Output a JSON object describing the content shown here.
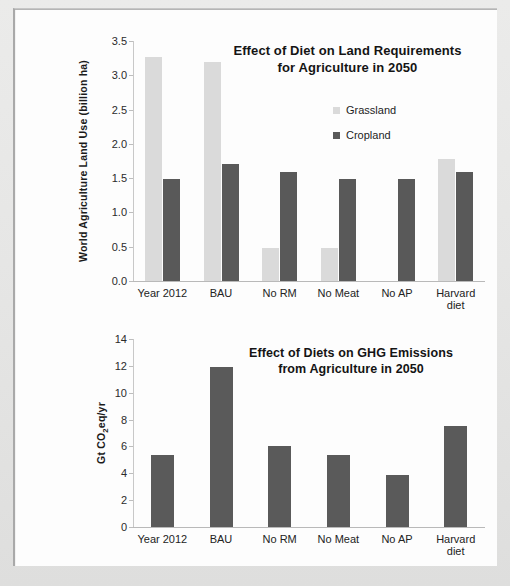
{
  "chart_data": [
    {
      "type": "bar",
      "id": "land-use",
      "title": "Effect of Diet on Land Requirements for Agriculture in 2050",
      "title_lines": [
        "Effect of Diet on Land Requirements",
        "for Agriculture in 2050"
      ],
      "xlabel": "",
      "ylabel": "World Agriculture Land Use (billion ha)",
      "ylim": [
        0.0,
        3.5
      ],
      "yticks": [
        "0.0",
        "0.5",
        "1.0",
        "1.5",
        "2.0",
        "2.5",
        "3.0",
        "3.5"
      ],
      "ytick_values": [
        0.0,
        0.5,
        1.0,
        1.5,
        2.0,
        2.5,
        3.0,
        3.5
      ],
      "grid": false,
      "legend_position": "inside-top-right",
      "categories": [
        "Year 2012",
        "BAU",
        "No RM",
        "No Meat",
        "No AP",
        "Harvard diet"
      ],
      "category_lines": [
        [
          "Year 2012"
        ],
        [
          "BAU"
        ],
        [
          "No RM"
        ],
        [
          "No Meat"
        ],
        [
          "No AP"
        ],
        [
          "Harvard",
          "diet"
        ]
      ],
      "series": [
        {
          "name": "Grassland",
          "color": "#dadada",
          "values": [
            3.27,
            3.19,
            0.48,
            0.48,
            0.0,
            1.78
          ]
        },
        {
          "name": "Cropland",
          "color": "#595959",
          "values": [
            1.49,
            1.7,
            1.59,
            1.49,
            1.49,
            1.59
          ]
        }
      ]
    },
    {
      "type": "bar",
      "id": "ghg-emissions",
      "title": "Effect of Diets on GHG Emissions from Agriculture in 2050",
      "title_lines": [
        "Effect of Diets on GHG Emissions",
        "from Agriculture in 2050"
      ],
      "xlabel": "",
      "ylabel": "Gt CO2eq/yr",
      "ylabel_parts": {
        "pre": "Gt CO",
        "sub": "2",
        "post": "eq/yr"
      },
      "ylim": [
        0,
        14
      ],
      "yticks": [
        "0",
        "2",
        "4",
        "6",
        "8",
        "10",
        "12",
        "14"
      ],
      "ytick_values": [
        0,
        2,
        4,
        6,
        8,
        10,
        12,
        14
      ],
      "grid": false,
      "legend_position": "none",
      "categories": [
        "Year 2012",
        "BAU",
        "No RM",
        "No Meat",
        "No AP",
        "Harvard diet"
      ],
      "category_lines": [
        [
          "Year 2012"
        ],
        [
          "BAU"
        ],
        [
          "No RM"
        ],
        [
          "No Meat"
        ],
        [
          "No AP"
        ],
        [
          "Harvard",
          "diet"
        ]
      ],
      "series": [
        {
          "name": "GHG Emissions",
          "color": "#5a5a5a",
          "values": [
            5.35,
            11.9,
            6.05,
            5.35,
            3.9,
            7.5
          ]
        }
      ]
    }
  ]
}
